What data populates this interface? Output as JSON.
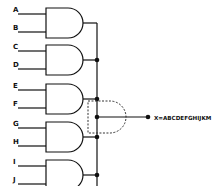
{
  "diagram": {
    "type": "logic-circuit",
    "gates": [
      {
        "id": "and-1",
        "kind": "AND",
        "inputs": [
          "A",
          "B"
        ]
      },
      {
        "id": "and-2",
        "kind": "AND",
        "inputs": [
          "C",
          "D"
        ]
      },
      {
        "id": "and-3",
        "kind": "AND",
        "inputs": [
          "E",
          "F"
        ]
      },
      {
        "id": "and-4",
        "kind": "AND",
        "inputs": [
          "G",
          "H"
        ]
      },
      {
        "id": "and-5",
        "kind": "AND",
        "inputs": [
          "I",
          "J"
        ]
      }
    ],
    "combiner": {
      "kind": "AND",
      "style": "dashed"
    },
    "output": {
      "label": "X=ABCDEFGHIJKM"
    }
  }
}
